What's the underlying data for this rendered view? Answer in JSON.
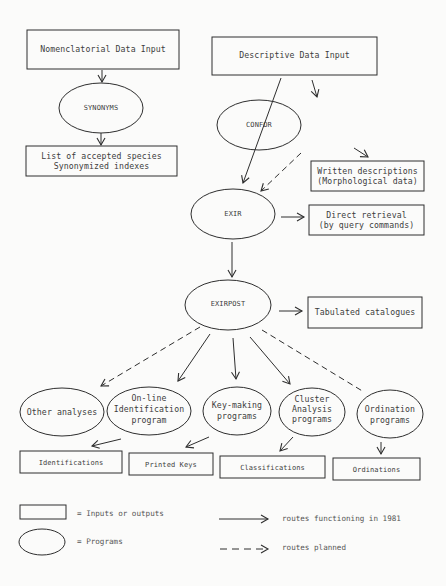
{
  "diagram": {
    "nodes": {
      "nomenclatorial_input": {
        "label": "Nomenclatorial Data Input",
        "shape": "box"
      },
      "synonyms": {
        "label": "SYNONYMS",
        "shape": "ellipse"
      },
      "accepted_species": {
        "line1": "List of accepted species",
        "line2": "Synonymized indexes",
        "shape": "box"
      },
      "descriptive_input": {
        "label": "Descriptive Data Input",
        "shape": "box"
      },
      "confor": {
        "label": "CONFOR",
        "shape": "ellipse"
      },
      "written_descriptions": {
        "line1": "Written descriptions",
        "line2": "(Morphological data)",
        "shape": "box"
      },
      "exir": {
        "label": "EXIR",
        "shape": "ellipse"
      },
      "direct_retrieval": {
        "line1": "Direct retrieval",
        "line2": "(by query commands)",
        "shape": "box"
      },
      "exirpost": {
        "label": "EXIRPOST",
        "shape": "ellipse"
      },
      "tabulated_catalogues": {
        "label": "Tabulated catalogues",
        "shape": "box"
      },
      "other_analyses": {
        "label": "Other analyses",
        "shape": "ellipse"
      },
      "online_identification": {
        "line1": "On-line",
        "line2": "Identification",
        "line3": "program",
        "shape": "ellipse"
      },
      "key_making": {
        "line1": "Key-making",
        "line2": "programs",
        "shape": "ellipse"
      },
      "cluster_analysis": {
        "line1": "Cluster",
        "line2": "Analysis",
        "line3": "programs",
        "shape": "ellipse"
      },
      "ordination": {
        "line1": "Ordination",
        "line2": "programs",
        "shape": "ellipse"
      },
      "identifications": {
        "label": "Identifications",
        "shape": "box"
      },
      "printed_keys": {
        "label": "Printed Keys",
        "shape": "box"
      },
      "classifications": {
        "label": "Classifications",
        "shape": "box"
      },
      "ordinations": {
        "label": "Ordinations",
        "shape": "box"
      }
    },
    "edges": [
      {
        "from": "nomenclatorial_input",
        "to": "synonyms",
        "style": "solid"
      },
      {
        "from": "synonyms",
        "to": "accepted_species",
        "style": "solid"
      },
      {
        "from": "descriptive_input",
        "to": "confor",
        "style": "solid"
      },
      {
        "from": "descriptive_input",
        "to": "exir",
        "style": "solid"
      },
      {
        "from": "confor",
        "to": "written_descriptions",
        "style": "solid"
      },
      {
        "from": "confor",
        "to": "exir",
        "style": "dashed"
      },
      {
        "from": "exir",
        "to": "direct_retrieval",
        "style": "solid"
      },
      {
        "from": "exir",
        "to": "exirpost",
        "style": "solid"
      },
      {
        "from": "exirpost",
        "to": "tabulated_catalogues",
        "style": "solid"
      },
      {
        "from": "exirpost",
        "to": "other_analyses",
        "style": "dashed"
      },
      {
        "from": "exirpost",
        "to": "online_identification",
        "style": "solid"
      },
      {
        "from": "exirpost",
        "to": "key_making",
        "style": "solid"
      },
      {
        "from": "exirpost",
        "to": "cluster_analysis",
        "style": "solid"
      },
      {
        "from": "exirpost",
        "to": "ordination",
        "style": "dashed"
      },
      {
        "from": "online_identification",
        "to": "identifications",
        "style": "solid"
      },
      {
        "from": "key_making",
        "to": "printed_keys",
        "style": "solid"
      },
      {
        "from": "cluster_analysis",
        "to": "classifications",
        "style": "solid"
      },
      {
        "from": "ordination",
        "to": "ordinations",
        "style": "solid"
      }
    ]
  },
  "legend": {
    "box_label": "= Inputs or outputs",
    "ellipse_label": "= Programs",
    "solid_label": "routes functioning in 1981",
    "dashed_label": "routes planned"
  },
  "colors": {
    "line": "#2e2e2e",
    "background": "#fbfbfa",
    "text": "#3d3d3d"
  }
}
